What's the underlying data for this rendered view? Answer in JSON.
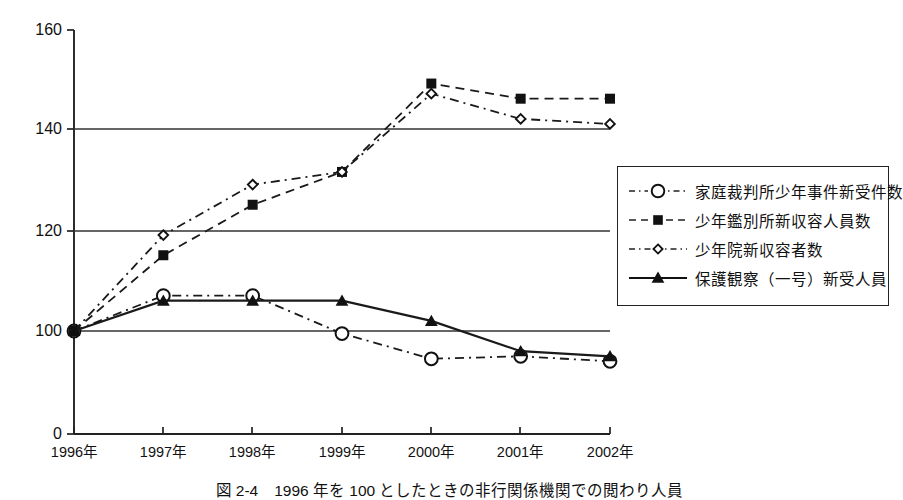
{
  "figure": {
    "caption": "図 2-4　1996 年を 100 としたときの非行関係機関での閲わり人員"
  },
  "axes": {
    "y_ticks": [
      "160",
      "140",
      "120",
      "100",
      "0"
    ],
    "x_ticks": [
      "1996年",
      "1997年",
      "1998年",
      "1999年",
      "2000年",
      "2001年",
      "2002年"
    ]
  },
  "legend": {
    "items": [
      {
        "label": "家庭裁判所少年事件新受件数",
        "marker": "open-circle-icon",
        "line": "dash-dot"
      },
      {
        "label": "少年鑑別所新収容人員数",
        "marker": "filled-square-icon",
        "line": "dashed"
      },
      {
        "label": "少年院新収容者数",
        "marker": "small-open-diamond-icon",
        "line": "dash-dot"
      },
      {
        "label": "保護観察（一号）新受人員",
        "marker": "filled-triangle-icon",
        "line": "solid"
      }
    ]
  },
  "chart_data": {
    "type": "line",
    "title": "",
    "xlabel": "",
    "ylabel": "",
    "x": [
      "1996年",
      "1997年",
      "1998年",
      "1999年",
      "2000年",
      "2001年",
      "2002年"
    ],
    "ylim": [
      0,
      160
    ],
    "y_tick_values": [
      0,
      100,
      120,
      140,
      160
    ],
    "axis_break": true,
    "grid": "horizontal",
    "legend_position": "right",
    "series": [
      {
        "name": "家庭裁判所少年事件新受件数",
        "marker": "open-circle",
        "line": "dash-dot",
        "values": [
          100,
          107,
          107,
          99.5,
          94.5,
          95,
          94
        ]
      },
      {
        "name": "少年鑑別所新収容人員数",
        "marker": "filled-square",
        "line": "dashed",
        "values": [
          100,
          115,
          125,
          131.5,
          149,
          146,
          146
        ]
      },
      {
        "name": "少年院新収容者数",
        "marker": "small-open-diamond",
        "line": "dash-dot",
        "values": [
          100,
          119,
          129,
          131.5,
          147,
          142,
          141
        ]
      },
      {
        "name": "保護観察（一号）新受人員",
        "marker": "filled-triangle",
        "line": "solid",
        "values": [
          100,
          106,
          106,
          106,
          102,
          96,
          95
        ]
      }
    ]
  }
}
